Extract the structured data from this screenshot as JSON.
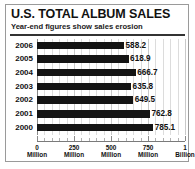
{
  "header": {
    "title": "U.S. TOTAL ALBUM SALES",
    "subtitle": "Year-end figures show sales erosion"
  },
  "chart_data": {
    "type": "bar",
    "orientation": "horizontal",
    "title": "U.S. TOTAL ALBUM SALES",
    "subtitle": "Year-end figures show sales erosion",
    "xlabel": "",
    "ylabel": "",
    "categories": [
      "2006",
      "2005",
      "2004",
      "2003",
      "2002",
      "2001",
      "2000"
    ],
    "values": [
      588.2,
      618.9,
      666.7,
      635.8,
      649.5,
      762.8,
      785.1
    ],
    "value_labels": [
      "588.2",
      "618.9",
      "666.7",
      "635.8",
      "649.5",
      "762.8",
      "785.1"
    ],
    "units": "millions of albums",
    "xlim": [
      0,
      1000
    ],
    "xticks": [
      0,
      250,
      500,
      750,
      1000
    ],
    "xtick_labels": [
      {
        "value": "0",
        "unit": "Million"
      },
      {
        "value": "250",
        "unit": "Million"
      },
      {
        "value": "500",
        "unit": "Million"
      },
      {
        "value": "750",
        "unit": "Million"
      },
      {
        "value": "1",
        "unit": "Billion"
      }
    ],
    "grid": true,
    "grid_axis": "x",
    "grid_minor_step": 50,
    "legend": false,
    "bar_color": "#141414",
    "grid_color": "#c9c9c9",
    "background": "#ffffff"
  }
}
